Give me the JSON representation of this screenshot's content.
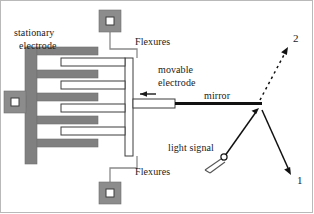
{
  "figure": {
    "background_color": "#ffffff",
    "ink_color": "#1a1a1a",
    "electrode_fill": "#808080",
    "pad_fill": "#8c8c8c",
    "pad_inner_fill": "#ffffff",
    "outline_color": "#595959"
  },
  "labels": {
    "stationary_electrode_line1": "stationary",
    "stationary_electrode_line2": "electrode",
    "flexures_top": "Flexures",
    "flexures_bottom": "Flexures",
    "movable_electrode_line1": "movable",
    "movable_electrode_line2": "electrode",
    "mirror": "mirror",
    "light_signal": "light signal",
    "port_two": "2",
    "port_one": "1"
  },
  "components": {
    "anchor_pads": [
      {
        "name": "anchor-pad-top",
        "x": 99,
        "y": 10,
        "size": 22
      },
      {
        "name": "anchor-pad-left",
        "x": 4,
        "y": 91,
        "size": 22
      },
      {
        "name": "anchor-pad-bottom",
        "x": 99,
        "y": 182,
        "size": 22
      }
    ],
    "stationary_fingers_count": 5,
    "movable_fingers_count": 4,
    "actuation_arrow_direction": "left",
    "beam_paths": [
      {
        "name": "incident-beam",
        "from": "light-source",
        "to": "mirror"
      },
      {
        "name": "reflected-beam-port-1",
        "from": "mirror",
        "to": "1"
      },
      {
        "name": "switched-beam-port-2",
        "from": "mirror",
        "to": "2",
        "style": "dashed"
      }
    ]
  }
}
